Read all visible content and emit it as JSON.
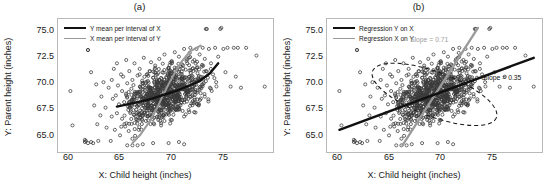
{
  "figure": {
    "width": 558,
    "height": 189,
    "background": "#ffffff"
  },
  "panels": [
    {
      "id": "a",
      "title": "(a)",
      "xlabel": "X: Child height (inches)",
      "ylabel": "Y: Parent height (inches)",
      "legend": [
        {
          "label": "Y mean per interval of X",
          "color": "#111111",
          "style": "solid-thick"
        },
        {
          "label": "X mean per interval of Y",
          "color": "#9a9a9a",
          "style": "solid-thin"
        }
      ]
    },
    {
      "id": "b",
      "title": "(b)",
      "xlabel": "X: Child height (inches)",
      "ylabel": "Y: Parent height (inches)",
      "legend": [
        {
          "label": "Regression Y on X",
          "color": "#111111",
          "style": "solid-thick"
        },
        {
          "label": "Regression X on Y",
          "color": "#9a9a9a",
          "style": "solid-thin"
        }
      ],
      "annotations": [
        {
          "text": "Slope = 0.71",
          "color": "#9d9d9d"
        },
        {
          "text": "Slope = 0.35",
          "color": "#141414"
        }
      ]
    }
  ],
  "chart_data": {
    "type": "scatter",
    "title": "",
    "subplots": [
      "(a)",
      "(b)"
    ],
    "xlabel": "X: Child height (inches)",
    "ylabel": "Y: Parent height (inches)",
    "xlim": [
      58.8,
      79.6
    ],
    "ylim": [
      64.0,
      76.0
    ],
    "xticks": [
      60,
      65,
      70,
      75
    ],
    "xticklabels": [
      "60",
      "65",
      "70",
      "75"
    ],
    "yticks": [
      65.0,
      67.5,
      70.0,
      72.5,
      75.0
    ],
    "yticklabels": [
      "65.0",
      "67.5",
      "70.0",
      "72.5",
      "75.0"
    ],
    "grid": false,
    "point_color": "#3a3a3a",
    "marker": "circle",
    "n_points": 898,
    "legend_position": "upper-left",
    "series": [
      {
        "name": "Y mean per interval of X",
        "panel": "(a)",
        "type": "line",
        "color": "#111111",
        "x": [
          64.5,
          65.5,
          66.5,
          67.5,
          68.5,
          69.5,
          70.5,
          71.5,
          72.5,
          73.5,
          74.3
        ],
        "y": [
          68.1,
          68.3,
          68.5,
          68.7,
          69.0,
          69.3,
          69.6,
          70.0,
          70.4,
          71.1,
          72.0
        ]
      },
      {
        "name": "X mean per interval of Y",
        "panel": "(a)",
        "type": "line",
        "color": "#9a9a9a",
        "x": [
          66.0,
          66.8,
          67.7,
          68.4,
          69.0,
          69.6,
          70.2,
          70.8,
          71.6,
          72.6
        ],
        "y": [
          64.8,
          65.6,
          66.8,
          68.0,
          69.2,
          70.3,
          71.3,
          72.2,
          73.1,
          73.6
        ]
      },
      {
        "name": "Regression Y on X",
        "panel": "(b)",
        "type": "line",
        "color": "#111111",
        "slope": 0.35,
        "x": [
          60.0,
          78.8
        ],
        "y": [
          66.0,
          72.5
        ]
      },
      {
        "name": "Regression X on Y",
        "panel": "(b)",
        "type": "line",
        "color": "#9a9a9a",
        "slope": 0.71,
        "x": [
          66.1,
          73.4
        ],
        "y": [
          64.6,
          75.2
        ]
      },
      {
        "name": "data-ellipse",
        "panel": "(b)",
        "type": "dashed-ellipse",
        "color": "#1a1a1a",
        "center_x": 69.2,
        "center_y": 69.2,
        "tilt_slope": 0.35
      }
    ],
    "annotations": [
      {
        "text": "Slope = 0.71",
        "panel": "(b)",
        "x": 70.2,
        "y": 74.1,
        "color": "#9d9d9d"
      },
      {
        "text": "Slope = 0.35",
        "panel": "(b)",
        "x": 75.4,
        "y": 71.0,
        "color": "#141414"
      }
    ],
    "points": [
      [
        61.7,
        73.2
      ],
      [
        61.7,
        73.2
      ],
      [
        60.0,
        69.5
      ],
      [
        60.2,
        66.4
      ],
      [
        61.4,
        64.9
      ],
      [
        61.4,
        65.1
      ],
      [
        61.5,
        65.0
      ],
      [
        61.7,
        64.8
      ],
      [
        62.0,
        71.2
      ],
      [
        62.3,
        68.2
      ],
      [
        62.5,
        70.1
      ],
      [
        62.6,
        66.5
      ],
      [
        62.7,
        65.0
      ],
      [
        62.9,
        67.3
      ],
      [
        63.0,
        69.0
      ],
      [
        63.2,
        70.3
      ],
      [
        63.4,
        68.0
      ],
      [
        63.5,
        66.2
      ],
      [
        63.7,
        69.8
      ],
      [
        63.9,
        65.0
      ],
      [
        64.0,
        67.2
      ],
      [
        64.0,
        70.5
      ],
      [
        64.1,
        68.8
      ],
      [
        64.2,
        71.5
      ],
      [
        64.3,
        66.0
      ],
      [
        64.4,
        69.1
      ],
      [
        64.5,
        72.0
      ],
      [
        64.5,
        67.5
      ],
      [
        64.6,
        70.0
      ],
      [
        64.7,
        68.3
      ],
      [
        64.8,
        65.5
      ],
      [
        64.9,
        71.0
      ],
      [
        65.0,
        69.5
      ],
      [
        65.0,
        67.0
      ],
      [
        65.1,
        70.8
      ],
      [
        65.2,
        68.5
      ],
      [
        65.3,
        66.3
      ],
      [
        65.4,
        72.3
      ],
      [
        65.5,
        69.0
      ],
      [
        65.5,
        70.2
      ],
      [
        65.6,
        67.8
      ],
      [
        65.7,
        71.3
      ],
      [
        65.8,
        68.0
      ],
      [
        65.9,
        69.7
      ],
      [
        66.0,
        65.2
      ],
      [
        66.0,
        70.5
      ],
      [
        66.1,
        68.6
      ],
      [
        66.2,
        72.0
      ],
      [
        66.3,
        67.2
      ],
      [
        66.4,
        69.3
      ],
      [
        66.5,
        70.9
      ],
      [
        66.5,
        68.1
      ],
      [
        66.6,
        66.0
      ],
      [
        66.7,
        71.5
      ],
      [
        66.8,
        69.0
      ],
      [
        66.9,
        67.6
      ],
      [
        67.0,
        70.2
      ],
      [
        67.0,
        68.4
      ],
      [
        67.1,
        72.5
      ],
      [
        67.2,
        69.6
      ],
      [
        67.3,
        66.8
      ],
      [
        67.4,
        71.0
      ],
      [
        67.5,
        68.9
      ],
      [
        67.5,
        70.4
      ],
      [
        67.6,
        67.3
      ],
      [
        67.7,
        69.8
      ],
      [
        67.8,
        72.1
      ],
      [
        67.9,
        68.2
      ],
      [
        68.0,
        70.7
      ],
      [
        68.0,
        69.2
      ],
      [
        68.1,
        66.5
      ],
      [
        68.2,
        71.8
      ],
      [
        68.3,
        69.0
      ],
      [
        68.4,
        67.9
      ],
      [
        68.5,
        70.3
      ],
      [
        68.5,
        68.6
      ],
      [
        68.6,
        72.4
      ],
      [
        68.7,
        69.5
      ],
      [
        68.8,
        67.1
      ],
      [
        68.9,
        71.2
      ],
      [
        69.0,
        68.8
      ],
      [
        69.0,
        70.0
      ],
      [
        69.1,
        72.8
      ],
      [
        69.2,
        69.3
      ],
      [
        69.3,
        67.4
      ],
      [
        69.4,
        70.9
      ],
      [
        69.5,
        68.3
      ],
      [
        69.5,
        71.6
      ],
      [
        69.6,
        69.9
      ],
      [
        69.7,
        66.9
      ],
      [
        69.8,
        72.2
      ],
      [
        69.9,
        68.7
      ],
      [
        70.0,
        70.6
      ],
      [
        70.0,
        69.1
      ],
      [
        70.1,
        73.0
      ],
      [
        70.2,
        67.8
      ],
      [
        70.3,
        71.4
      ],
      [
        70.4,
        69.4
      ],
      [
        70.5,
        68.0
      ],
      [
        70.5,
        72.6
      ],
      [
        70.6,
        70.1
      ],
      [
        70.7,
        68.5
      ],
      [
        70.8,
        71.9
      ],
      [
        70.9,
        69.7
      ],
      [
        71.0,
        67.2
      ],
      [
        71.0,
        73.3
      ],
      [
        71.1,
        70.4
      ],
      [
        71.2,
        68.9
      ],
      [
        71.3,
        72.0
      ],
      [
        71.4,
        69.2
      ],
      [
        71.5,
        70.8
      ],
      [
        71.5,
        67.6
      ],
      [
        71.6,
        73.4
      ],
      [
        71.7,
        69.0
      ],
      [
        71.8,
        71.5
      ],
      [
        71.9,
        68.4
      ],
      [
        72.0,
        72.3
      ],
      [
        72.0,
        70.0
      ],
      [
        72.1,
        69.6
      ],
      [
        72.2,
        73.3
      ],
      [
        72.3,
        71.1
      ],
      [
        72.4,
        68.2
      ],
      [
        72.5,
        70.5
      ],
      [
        72.5,
        72.8
      ],
      [
        72.6,
        69.3
      ],
      [
        72.7,
        71.7
      ],
      [
        72.8,
        73.4
      ],
      [
        72.9,
        70.2
      ],
      [
        73.0,
        72.4
      ],
      [
        73.0,
        69.0
      ],
      [
        73.1,
        71.3
      ],
      [
        73.2,
        75.1
      ],
      [
        73.3,
        70.7
      ],
      [
        73.4,
        73.3
      ],
      [
        73.5,
        69.8
      ],
      [
        73.6,
        72.0
      ],
      [
        73.8,
        71.0
      ],
      [
        74.0,
        73.4
      ],
      [
        74.1,
        70.3
      ],
      [
        74.3,
        72.6
      ],
      [
        74.5,
        75.1
      ],
      [
        74.6,
        75.2
      ],
      [
        74.8,
        73.3
      ],
      [
        75.0,
        71.2
      ],
      [
        75.2,
        73.4
      ],
      [
        75.5,
        69.9
      ],
      [
        75.8,
        73.4
      ],
      [
        76.0,
        70.8
      ],
      [
        76.2,
        73.4
      ],
      [
        76.5,
        69.8
      ],
      [
        77.0,
        73.4
      ],
      [
        78.0,
        72.7
      ],
      [
        78.8,
        69.9
      ],
      [
        73.1,
        75.1
      ],
      [
        65.5,
        64.6
      ],
      [
        66.0,
        64.6
      ],
      [
        66.5,
        64.6
      ],
      [
        67.0,
        64.7
      ],
      [
        68.0,
        64.8
      ],
      [
        69.5,
        64.8
      ],
      [
        70.5,
        64.9
      ],
      [
        71.0,
        64.7
      ],
      [
        62.0,
        64.9
      ],
      [
        62.2,
        64.8
      ]
    ]
  }
}
